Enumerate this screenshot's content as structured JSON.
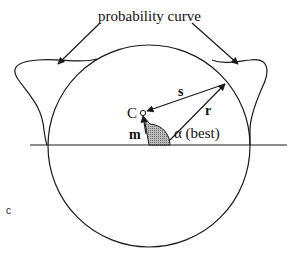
{
  "diagram": {
    "title_label": "probability curve",
    "point_label": "C",
    "vector_s_label": "s",
    "vector_r_label": "r",
    "vector_m_label": "m",
    "angle_label": "α (best)",
    "panel_label": "c",
    "colors": {
      "stroke": "#1a1a1a",
      "angle_fill": "#9a9a9a",
      "background": "#ffffff"
    }
  }
}
